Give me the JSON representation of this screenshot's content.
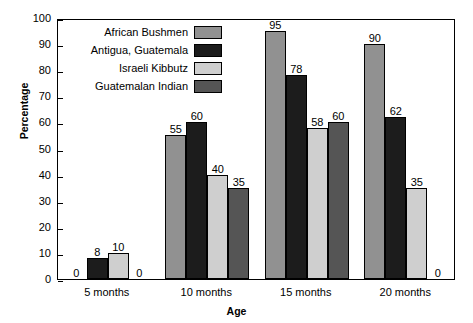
{
  "chart_data": {
    "type": "bar",
    "title": "",
    "xlabel": "Age",
    "ylabel": "Percentage",
    "categories": [
      "5 months",
      "10 months",
      "15 months",
      "20 months"
    ],
    "ylim": [
      0,
      100
    ],
    "yticks": [
      "0",
      "10",
      "20",
      "30",
      "40",
      "50",
      "60",
      "70",
      "80",
      "90",
      "100"
    ],
    "grid": false,
    "legend_position": "top-left-inside",
    "series": [
      {
        "name": "African Bushmen",
        "color": "#919191",
        "values": [
          0,
          55,
          95,
          90
        ],
        "labels": [
          "0",
          "55",
          "95",
          "90"
        ]
      },
      {
        "name": "Antigua, Guatemala",
        "color": "#1c1c1c",
        "values": [
          8,
          60,
          78,
          62
        ],
        "labels": [
          "8",
          "60",
          "78",
          "62"
        ]
      },
      {
        "name": "Israeli Kibbutz",
        "color": "#cfcfcf",
        "values": [
          10,
          40,
          58,
          35
        ],
        "labels": [
          "10",
          "40",
          "58",
          "35"
        ]
      },
      {
        "name": "Guatemalan Indian",
        "color": "#555555",
        "values": [
          0,
          35,
          60,
          0
        ],
        "labels": [
          "0",
          "35",
          "60",
          "0"
        ]
      }
    ]
  }
}
